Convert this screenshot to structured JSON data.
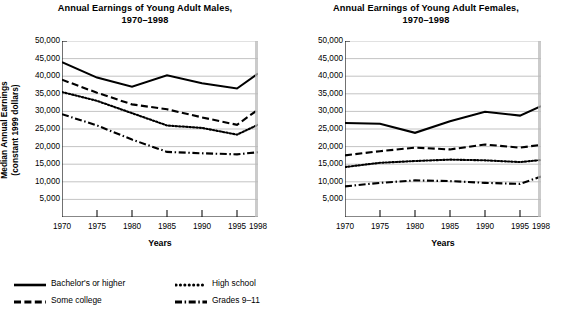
{
  "figure": {
    "axis_title_x": "Years",
    "axis_title_y_line1": "Median Annual Earnings",
    "axis_title_y_line2": "(constant 1999 dollars)"
  },
  "legend": {
    "items": [
      {
        "label": "Bachelor's or higher",
        "style": "solid",
        "icon": "solid-line-icon"
      },
      {
        "label": "High school",
        "style": "dotted",
        "icon": "dotted-line-icon"
      },
      {
        "label": "Some college",
        "style": "dashed",
        "icon": "dashed-line-icon"
      },
      {
        "label": "Grades 9–11",
        "style": "dashdot",
        "icon": "dash-dot-line-icon"
      }
    ]
  },
  "chart_data": [
    {
      "type": "line",
      "id": "males",
      "title": "Annual Earnings of Young Adult Males,",
      "title_line2": "1970–1998",
      "xlabel": "Years",
      "ylabel": "Median Annual Earnings (constant 1999 dollars)",
      "grid": true,
      "legend_position": "below-figure",
      "x": [
        1970,
        1975,
        1980,
        1985,
        1990,
        1995,
        1998
      ],
      "xlim": [
        1970,
        1998
      ],
      "ylim": [
        0,
        50000
      ],
      "yticks": [
        5000,
        10000,
        15000,
        20000,
        25000,
        30000,
        35000,
        40000,
        45000,
        50000
      ],
      "ytick_labels": [
        "5,000",
        "10,000",
        "15,000",
        "20,000",
        "25,000",
        "30,000",
        "35,000",
        "40,000",
        "45,000",
        "50,000"
      ],
      "xtick_labels": [
        "1970",
        "1975",
        "1980",
        "1985",
        "1990",
        "1995",
        "1998"
      ],
      "series": [
        {
          "name": "Bachelor's or higher",
          "style": "solid",
          "values": [
            44000,
            39600,
            37000,
            40250,
            38000,
            36500,
            40750
          ]
        },
        {
          "name": "Some college",
          "style": "dashed",
          "values": [
            39000,
            35300,
            32000,
            30600,
            28300,
            26200,
            30500
          ]
        },
        {
          "name": "High school",
          "style": "dotted",
          "values": [
            35500,
            33000,
            29500,
            26000,
            25300,
            23400,
            26200
          ]
        },
        {
          "name": "Grades 9–11",
          "style": "dashdot",
          "values": [
            29200,
            26000,
            22000,
            18500,
            18100,
            17800,
            18400
          ]
        }
      ]
    },
    {
      "type": "line",
      "id": "females",
      "title": "Annual Earnings of Young Adult Females,",
      "title_line2": "1970–1998",
      "xlabel": "Years",
      "ylabel": "Median Annual Earnings (constant 1999 dollars)",
      "grid": true,
      "legend_position": "below-figure",
      "x": [
        1970,
        1975,
        1980,
        1985,
        1990,
        1995,
        1998
      ],
      "xlim": [
        1970,
        1998
      ],
      "ylim": [
        0,
        50000
      ],
      "yticks": [
        5000,
        10000,
        15000,
        20000,
        25000,
        30000,
        35000,
        40000,
        45000,
        50000
      ],
      "ytick_labels": [
        "5,000",
        "10,000",
        "15,000",
        "20,000",
        "25,000",
        "30,000",
        "35,000",
        "40,000",
        "45,000",
        "50,000"
      ],
      "xtick_labels": [
        "1970",
        "1975",
        "1980",
        "1985",
        "1990",
        "1995",
        "1998"
      ],
      "series": [
        {
          "name": "Bachelor's or higher",
          "style": "solid",
          "values": [
            26700,
            26500,
            23900,
            27200,
            29900,
            28800,
            31500
          ]
        },
        {
          "name": "Some college",
          "style": "dashed",
          "values": [
            17500,
            18700,
            19700,
            19200,
            20600,
            19700,
            20500
          ]
        },
        {
          "name": "High school",
          "style": "dotted",
          "values": [
            14200,
            15400,
            15900,
            16300,
            16100,
            15600,
            16200
          ]
        },
        {
          "name": "Grades 9–11",
          "style": "dashdot",
          "values": [
            8700,
            9700,
            10400,
            10200,
            9700,
            9400,
            11500
          ]
        }
      ]
    }
  ]
}
